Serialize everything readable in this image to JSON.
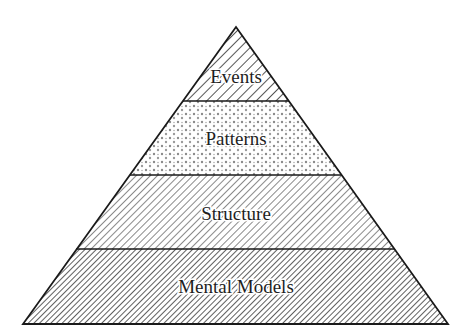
{
  "diagram": {
    "type": "pyramid",
    "title": "",
    "layers": [
      {
        "label": "Events",
        "pattern": "diagonal-hatch-sparse"
      },
      {
        "label": "Patterns",
        "pattern": "dots"
      },
      {
        "label": "Structure",
        "pattern": "diagonal-hatch-medium"
      },
      {
        "label": "Mental Models",
        "pattern": "diagonal-hatch-dense"
      }
    ],
    "colors": {
      "stroke": "#1a1a1a",
      "background": "#ffffff",
      "hatch": "#2a2a2a",
      "dots": "#8a8a8a"
    }
  }
}
